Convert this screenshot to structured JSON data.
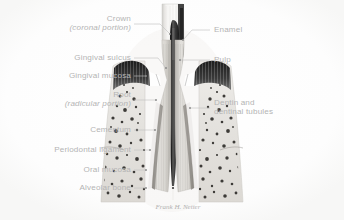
{
  "figure": {
    "style": "grayscale medical illustration",
    "background_color": "#ffffff",
    "label_color": "#b4b4b4",
    "leader_color": "#c2c2c2",
    "signature": "Frank H. Netter"
  },
  "labels_left": [
    {
      "id": "crown",
      "line1": "Crown",
      "line2": "(coronal portion)",
      "italic2": true
    },
    {
      "id": "gingival-sulcus",
      "line1": "Gingival sulcus",
      "line2": "",
      "italic2": false
    },
    {
      "id": "gingival-mucosa",
      "line1": "Gingival mucosa",
      "line2": "",
      "italic2": false
    },
    {
      "id": "root",
      "line1": "Root",
      "line2": "(radicular portion)",
      "italic2": true
    },
    {
      "id": "cementum",
      "line1": "Cementum",
      "line2": "",
      "italic2": false
    },
    {
      "id": "periodontal-ligament",
      "line1": "Periodontal ligament",
      "line2": "",
      "italic2": false
    },
    {
      "id": "oral-mucosa",
      "line1": "Oral mucosa",
      "line2": "",
      "italic2": false
    },
    {
      "id": "alveolar-bone",
      "line1": "Alveolar bone",
      "line2": "",
      "italic2": false
    }
  ],
  "labels_right": [
    {
      "id": "enamel",
      "line1": "Enamel",
      "line2": ""
    },
    {
      "id": "pulp",
      "line1": "Pulp",
      "line2": ""
    },
    {
      "id": "dentin",
      "line1": "Dentin and",
      "line2": "dentinal tubules"
    }
  ],
  "anatomy_colors": {
    "enamel": "#f2f2f0",
    "dentin": "#d8d6d2",
    "pulp": "#3a3a3a",
    "gingiva_dark": "#2a2a2a",
    "bone": "#e6e4e0",
    "trabecula": "#4a4a4a"
  }
}
